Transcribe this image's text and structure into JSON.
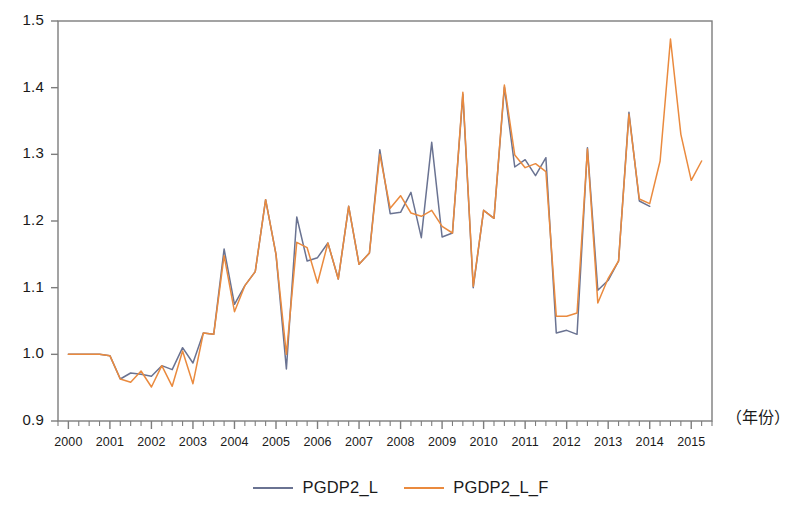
{
  "chart_data": {
    "type": "line",
    "title": "",
    "subtitle": "",
    "xlabel": "（年份）",
    "ylabel": "",
    "xlim": [
      1999.75,
      2015.5
    ],
    "ylim": [
      0.9,
      1.5
    ],
    "yticks": [
      "0.9",
      "1.0",
      "1.1",
      "1.2",
      "1.3",
      "1.4",
      "1.5"
    ],
    "ytick_values": [
      0.9,
      1.0,
      1.1,
      1.2,
      1.3,
      1.4,
      1.5
    ],
    "xticks": [
      "2000",
      "2001",
      "2002",
      "2003",
      "2004",
      "2005",
      "2006",
      "2007",
      "2008",
      "2009",
      "2010",
      "2011",
      "2012",
      "2013",
      "2014",
      "2015"
    ],
    "xtick_values": [
      2000,
      2001,
      2002,
      2003,
      2004,
      2005,
      2006,
      2007,
      2008,
      2009,
      2010,
      2011,
      2012,
      2013,
      2014,
      2015
    ],
    "minor_ticks_per_interval": 4,
    "grid": false,
    "legend_position": "bottom-center",
    "frame": true,
    "x": [
      2000.0,
      2000.25,
      2000.5,
      2000.75,
      2001.0,
      2001.25,
      2001.5,
      2001.75,
      2002.0,
      2002.25,
      2002.5,
      2002.75,
      2003.0,
      2003.25,
      2003.5,
      2003.75,
      2004.0,
      2004.25,
      2004.5,
      2004.75,
      2005.0,
      2005.25,
      2005.5,
      2005.75,
      2006.0,
      2006.25,
      2006.5,
      2006.75,
      2007.0,
      2007.25,
      2007.5,
      2007.75,
      2008.0,
      2008.25,
      2008.5,
      2008.75,
      2009.0,
      2009.25,
      2009.5,
      2009.75,
      2010.0,
      2010.25,
      2010.5,
      2010.75,
      2011.0,
      2011.25,
      2011.5,
      2011.75,
      2012.0,
      2012.25,
      2012.5,
      2012.75,
      2013.0,
      2013.25,
      2013.5,
      2013.75,
      2014.0,
      2014.25,
      2014.5,
      2014.75,
      2015.0,
      2015.25
    ],
    "series": [
      {
        "name": "PGDP2_L",
        "color": "#6a7392",
        "values": [
          1.0,
          1.0,
          1.0,
          1.0,
          0.998,
          0.963,
          0.972,
          0.97,
          0.967,
          0.983,
          0.977,
          1.01,
          0.987,
          1.032,
          1.03,
          1.158,
          1.075,
          1.103,
          1.124,
          1.232,
          1.15,
          0.978,
          1.206,
          1.14,
          1.145,
          1.167,
          1.113,
          1.222,
          1.135,
          1.152,
          1.307,
          1.211,
          1.213,
          1.243,
          1.175,
          1.318,
          1.176,
          1.182,
          1.39,
          1.1,
          1.216,
          1.204,
          1.401,
          1.281,
          1.292,
          1.268,
          1.295,
          1.032,
          1.036,
          1.03,
          1.31,
          1.096,
          1.111,
          1.14,
          1.363,
          1.23,
          1.222,
          null,
          null,
          null,
          null,
          null
        ]
      },
      {
        "name": "PGDP2_L_F",
        "color": "#ea8a3e",
        "values": [
          1.0,
          1.0,
          1.0,
          1.0,
          0.998,
          0.963,
          0.958,
          0.975,
          0.951,
          0.983,
          0.952,
          1.005,
          0.956,
          1.032,
          1.03,
          1.148,
          1.064,
          1.103,
          1.124,
          1.232,
          1.15,
          1.0,
          1.168,
          1.16,
          1.107,
          1.167,
          1.113,
          1.222,
          1.135,
          1.152,
          1.3,
          1.219,
          1.238,
          1.212,
          1.207,
          1.216,
          1.192,
          1.182,
          1.393,
          1.102,
          1.216,
          1.204,
          1.404,
          1.299,
          1.28,
          1.286,
          1.274,
          1.057,
          1.057,
          1.062,
          1.308,
          1.077,
          1.114,
          1.14,
          1.36,
          1.233,
          1.226,
          1.29,
          1.473,
          1.33,
          1.261,
          1.29
        ]
      }
    ]
  },
  "legend": {
    "entries": [
      {
        "label": "PGDP2_L",
        "color": "#6a7392"
      },
      {
        "label": "PGDP2_L_F",
        "color": "#ea8a3e"
      }
    ]
  },
  "axis": {
    "x_unit_label": "（年份）"
  }
}
